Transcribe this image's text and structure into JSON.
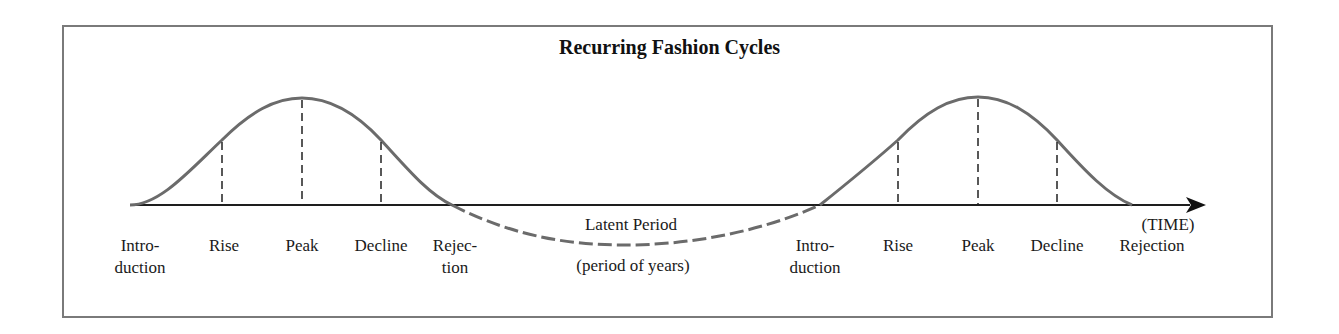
{
  "title": "Recurring Fashion Cycles",
  "axis_label": "(TIME)",
  "cycle1": {
    "stages": [
      {
        "line1": "Intro-",
        "line2": "duction",
        "x": 140
      },
      {
        "line1": "Rise",
        "line2": "",
        "x": 224
      },
      {
        "line1": "Peak",
        "line2": "",
        "x": 302
      },
      {
        "line1": "Decline",
        "line2": "",
        "x": 381
      },
      {
        "line1": "Rejec-",
        "line2": "tion",
        "x": 455
      }
    ]
  },
  "latent": {
    "label": "Latent Period",
    "sublabel": "(period of years)"
  },
  "cycle2": {
    "stages": [
      {
        "line1": "Intro-",
        "line2": "duction",
        "x": 815
      },
      {
        "line1": "Rise",
        "line2": "",
        "x": 898
      },
      {
        "line1": "Peak",
        "line2": "",
        "x": 978
      },
      {
        "line1": "Decline",
        "line2": "",
        "x": 1057
      },
      {
        "line1": "Rejection",
        "line2": "",
        "x": 1152
      }
    ]
  },
  "colors": {
    "curve": "#6b6b6b",
    "axis": "#1e1e1e",
    "frame": "#7a7a7a"
  }
}
